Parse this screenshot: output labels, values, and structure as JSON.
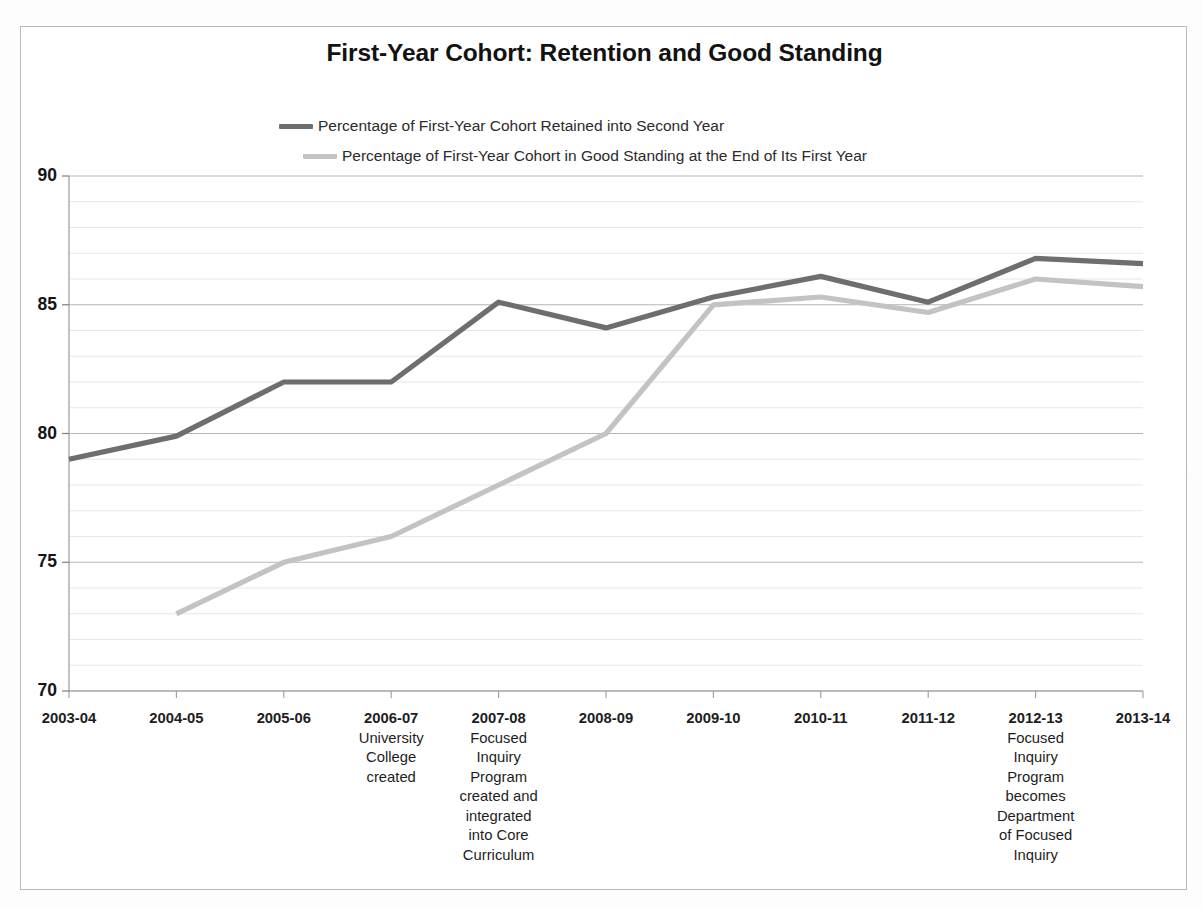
{
  "chart_data": {
    "type": "line",
    "title": "First-Year Cohort: Retention and Good Standing",
    "xlabel": "",
    "ylabel": "",
    "ylim": [
      70,
      90
    ],
    "yticks": [
      70,
      75,
      80,
      85,
      90
    ],
    "grid": true,
    "minor_grid_step": 1,
    "legend_position": "top-left",
    "categories": [
      "2003-04",
      "2004-05",
      "2005-06",
      "2006-07",
      "2007-08",
      "2008-09",
      "2009-10",
      "2010-11",
      "2011-12",
      "2012-13",
      "2013-14"
    ],
    "category_notes": [
      "",
      "",
      "",
      "University College created",
      "Focused Inquiry Program created and integrated into Core Curriculum",
      "",
      "",
      "",
      "",
      "Focused Inquiry Program becomes Department of Focused Inquiry",
      ""
    ],
    "series": [
      {
        "name": "Percentage of First-Year Cohort Retained into Second Year",
        "color": "#6e6e6e",
        "values": [
          79.0,
          79.9,
          82.0,
          82.0,
          85.1,
          84.1,
          85.3,
          86.1,
          85.1,
          86.8,
          86.6
        ]
      },
      {
        "name": "Percentage of First-Year Cohort in Good Standing at the End of Its First Year",
        "color": "#c3c3c3",
        "values": [
          null,
          73.0,
          75.0,
          76.0,
          78.0,
          80.0,
          85.0,
          85.3,
          84.7,
          86.0,
          85.7
        ]
      }
    ]
  },
  "legend": {
    "items": [
      {
        "label": "Percentage of First-Year Cohort Retained into Second Year",
        "color": "#6e6e6e"
      },
      {
        "label": "Percentage of First-Year Cohort in Good Standing at the End of Its First Year",
        "color": "#c3c3c3"
      }
    ]
  },
  "axis": {
    "y_labels": [
      "90",
      "85",
      "80",
      "75",
      "70"
    ],
    "x_labels": [
      {
        "year": "2003-04",
        "note": []
      },
      {
        "year": "2004-05",
        "note": []
      },
      {
        "year": "2005-06",
        "note": []
      },
      {
        "year": "2006-07",
        "note": [
          "University",
          "College",
          "created"
        ]
      },
      {
        "year": "2007-08",
        "note": [
          "Focused",
          "Inquiry",
          "Program",
          "created and",
          "integrated",
          "into Core",
          "Curriculum"
        ]
      },
      {
        "year": "2008-09",
        "note": []
      },
      {
        "year": "2009-10",
        "note": []
      },
      {
        "year": "2010-11",
        "note": []
      },
      {
        "year": "2011-12",
        "note": []
      },
      {
        "year": "2012-13",
        "note": [
          "Focused",
          "Inquiry",
          "Program",
          "becomes",
          "Department",
          "of Focused",
          "Inquiry"
        ]
      },
      {
        "year": "2013-14",
        "note": []
      }
    ]
  },
  "colors": {
    "series_dark": "#6e6e6e",
    "series_light": "#c3c3c3",
    "grid_major": "#b5b5b5",
    "grid_minor": "#e6e6e6",
    "frame": "#b9b9b9",
    "text": "#1a1a1a"
  }
}
